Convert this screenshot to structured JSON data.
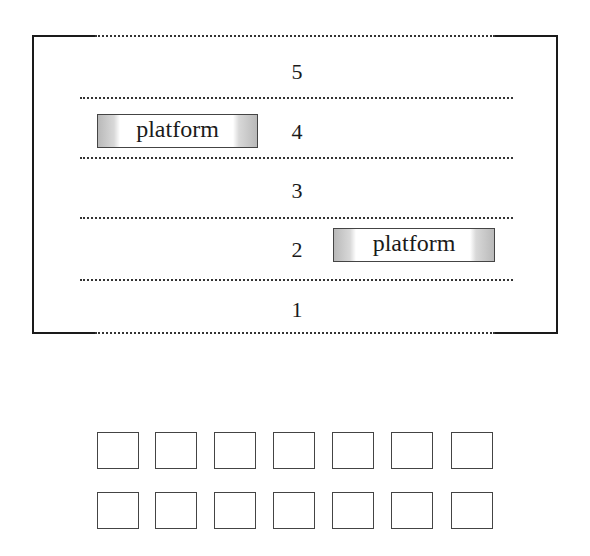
{
  "building": {
    "floors": [
      {
        "number": "5",
        "top": 59
      },
      {
        "number": "4",
        "top": 119
      },
      {
        "number": "3",
        "top": 178
      },
      {
        "number": "2",
        "top": 237
      },
      {
        "number": "1",
        "top": 297
      }
    ],
    "floor_dividers_y": [
      97,
      157,
      217,
      279
    ]
  },
  "platforms": [
    {
      "label": "platform",
      "floor": "4",
      "left": 97,
      "top": 114,
      "width": 161
    },
    {
      "label": "platform",
      "floor": "2",
      "left": 333,
      "top": 228,
      "width": 162
    }
  ],
  "square_grid": {
    "rows": 2,
    "columns": 7,
    "row_tops": [
      432,
      492
    ],
    "column_lefts": [
      97,
      155,
      214,
      273,
      332,
      391,
      451
    ]
  }
}
